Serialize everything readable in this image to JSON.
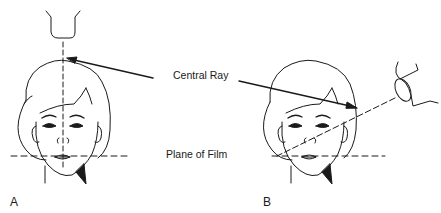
{
  "figure": {
    "labels": {
      "central_ray": "Central Ray",
      "plane_of_film": "Plane of Film"
    },
    "panels": [
      {
        "id": "A",
        "label": "A",
        "description": "Frontal head with X-ray tube directly above; central ray vertical, perpendicular to plane of film"
      },
      {
        "id": "B",
        "label": "B",
        "description": "Frontal head with X-ray tube angled at right; central ray oblique to plane of film"
      }
    ],
    "colors": {
      "line": "#1a1a1a",
      "background": "#ffffff"
    }
  }
}
